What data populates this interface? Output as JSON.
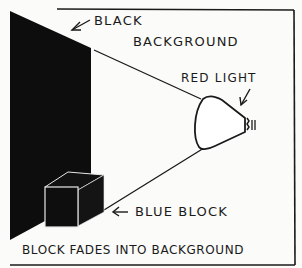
{
  "diagram": {
    "labels": {
      "black_background_line1": "BLACK",
      "black_background_line2": "BACKGROUND",
      "red_light": "RED LIGHT",
      "blue_block": "BLUE BLOCK",
      "caption": "BLOCK FADES INTO BACKGROUND"
    },
    "arrows": {
      "black_background": "←",
      "blue_block": "←"
    },
    "elements": [
      {
        "id": "black-background",
        "type": "wall",
        "color": "#0d0d0d"
      },
      {
        "id": "blue-block",
        "type": "cube",
        "color": "#111111"
      },
      {
        "id": "red-light",
        "type": "bulb",
        "color": "#ffffff"
      }
    ],
    "colors": {
      "ink": "#1a1a1a",
      "paper": "#fbfbf9",
      "fill": "#0d0d0d"
    }
  }
}
